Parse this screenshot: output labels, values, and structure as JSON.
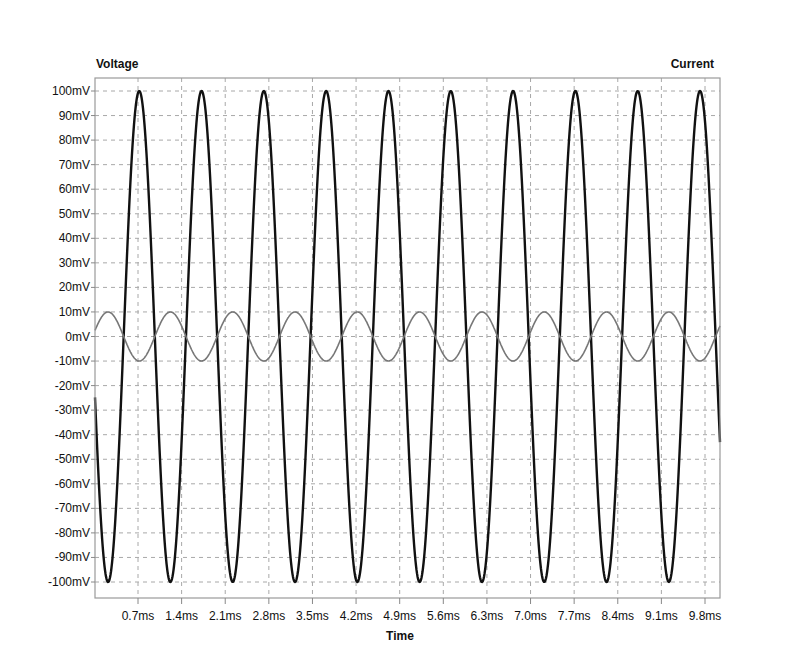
{
  "chart_data": {
    "type": "line",
    "title": "",
    "xlabel": "Time",
    "ylabel": "Voltage",
    "y2label": "Current",
    "xlim": [
      0,
      10.0
    ],
    "ylim": [
      -100,
      100
    ],
    "x_unit": "ms",
    "y_unit": "mV",
    "grid": true,
    "grid_style": "dashed",
    "legend": null,
    "x_ticks": [
      "0.7ms",
      "1.4ms",
      "2.1ms",
      "2.8ms",
      "3.5ms",
      "4.2ms",
      "4.9ms",
      "5.6ms",
      "6.3ms",
      "7.0ms",
      "7.7ms",
      "8.4ms",
      "9.1ms",
      "9.8ms"
    ],
    "x_tick_values": [
      0.7,
      1.4,
      2.1,
      2.8,
      3.5,
      4.2,
      4.9,
      5.6,
      6.3,
      7.0,
      7.7,
      8.4,
      9.1,
      9.8
    ],
    "y_ticks": [
      "100mV",
      "90mV",
      "80mV",
      "70mV",
      "60mV",
      "50mV",
      "40mV",
      "30mV",
      "20mV",
      "10mV",
      "0mV",
      "-10mV",
      "-20mV",
      "-30mV",
      "-40mV",
      "-50mV",
      "-60mV",
      "-70mV",
      "-80mV",
      "-90mV",
      "-100mV"
    ],
    "y_tick_values": [
      100,
      90,
      80,
      70,
      60,
      50,
      40,
      30,
      20,
      10,
      0,
      -10,
      -20,
      -30,
      -40,
      -50,
      -60,
      -70,
      -80,
      -90,
      -100
    ],
    "series": [
      {
        "name": "Voltage",
        "color": "#111111",
        "line_width": 2.4,
        "waveform": "sine",
        "amplitude": 100,
        "frequency_khz": 1.0,
        "period_ms": 1.0,
        "first_peak_ms": 0.72,
        "first_trough_ms": 0.22,
        "peaks_ms": [
          0.72,
          1.72,
          2.72,
          3.72,
          4.72,
          5.72,
          6.72,
          7.72,
          8.72,
          9.72
        ],
        "troughs_ms": [
          0.22,
          1.22,
          2.22,
          3.22,
          4.22,
          5.22,
          6.22,
          7.22,
          8.22,
          9.22
        ]
      },
      {
        "name": "Current",
        "color": "#777777",
        "line_width": 1.6,
        "waveform": "sine",
        "amplitude": 10,
        "frequency_khz": 1.0,
        "period_ms": 1.0,
        "first_peak_ms": 0.22,
        "first_trough_ms": 0.72,
        "peaks_ms": [
          0.22,
          1.22,
          2.22,
          3.22,
          4.22,
          5.22,
          6.22,
          7.22,
          8.22,
          9.22
        ],
        "troughs_ms": [
          0.72,
          1.72,
          2.72,
          3.72,
          4.72,
          5.72,
          6.72,
          7.72,
          8.72,
          9.72
        ]
      }
    ]
  },
  "labels": {
    "left_axis_title": "Voltage",
    "right_axis_title": "Current",
    "x_axis_title": "Time"
  },
  "colors": {
    "background": "#ffffff",
    "frame": "#9a9a9a",
    "grid": "#a8a8a8",
    "text": "#111111"
  }
}
